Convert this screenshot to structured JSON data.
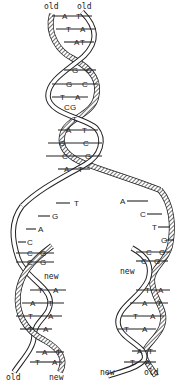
{
  "figure": {
    "strand_labels": {
      "top_left": "old",
      "top_right": "old",
      "fork_left_new": "new",
      "fork_right_new": "new",
      "bottom_left_old": "old",
      "bottom_left_new": "new",
      "bottom_right_new": "new",
      "bottom_right_old": "old"
    },
    "parent_helix": {
      "pairs": [
        {
          "left": "A",
          "right": "T"
        },
        {
          "left": "T",
          "right": "A"
        },
        {
          "left": "A",
          "right": "T"
        },
        {
          "left": "G",
          "right": "C"
        },
        {
          "left": "G",
          "right": "C"
        },
        {
          "left": "T",
          "right": "A"
        },
        {
          "left": "C",
          "right": "G"
        },
        {
          "left": "T",
          "right": ""
        },
        {
          "left": "A",
          "right": "T"
        },
        {
          "left": "G",
          "right": "C"
        },
        {
          "left": "C",
          "right": "G"
        },
        {
          "left": "A",
          "right": "T"
        }
      ]
    },
    "fork": {
      "left_template_unpaired": [
        "T",
        "G",
        "A",
        "C"
      ],
      "left_template_paired": [
        {
          "old": "C",
          "new": "G"
        },
        {
          "old": "C",
          "new": "G"
        }
      ],
      "right_template_unpaired": [
        "A",
        "C",
        "T",
        "G"
      ],
      "right_template_paired": [
        {
          "new": "C",
          "old": "G"
        },
        {
          "new": "C",
          "old": "G"
        }
      ]
    },
    "daughter_left": {
      "pairs": [
        {
          "left": "T",
          "right": "A"
        },
        {
          "left": "A",
          "right": "T"
        },
        {
          "left": "T",
          "right": "A"
        },
        {
          "left": "T",
          "right": "A"
        },
        {
          "left": "A",
          "right": "T"
        },
        {
          "left": "T",
          "right": "A"
        }
      ]
    },
    "daughter_right": {
      "pairs": [
        {
          "left": "T",
          "right": "A"
        },
        {
          "left": "A",
          "right": "T"
        },
        {
          "left": "T",
          "right": "A"
        },
        {
          "left": "T",
          "right": "A"
        },
        {
          "left": "A",
          "right": "T"
        },
        {
          "left": "T",
          "right": "A"
        }
      ]
    }
  }
}
